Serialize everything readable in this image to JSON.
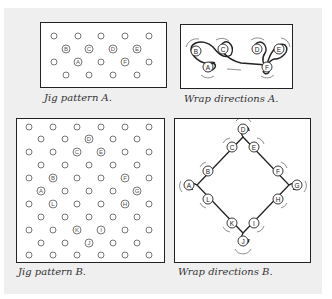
{
  "figures": {
    "jig_a": {
      "caption": "Jig pattern A.",
      "labels": [
        "A",
        "B",
        "C",
        "D",
        "E",
        "F"
      ]
    },
    "wrap_a": {
      "caption": "Wrap directions A.",
      "labels": [
        "A",
        "B",
        "C",
        "D",
        "E",
        "F"
      ]
    },
    "jig_b": {
      "caption": "Jig pattern B.",
      "labels": [
        "A",
        "B",
        "C",
        "D",
        "E",
        "F",
        "G",
        "H",
        "I",
        "J",
        "K",
        "L"
      ]
    },
    "wrap_b": {
      "caption": "Wrap directions B.",
      "labels": [
        "A",
        "B",
        "C",
        "D",
        "E",
        "F",
        "G",
        "H",
        "I",
        "J",
        "K",
        "L"
      ]
    }
  },
  "colors": {
    "panel": "#efefef",
    "line": "#222222",
    "peg": "#555555"
  }
}
